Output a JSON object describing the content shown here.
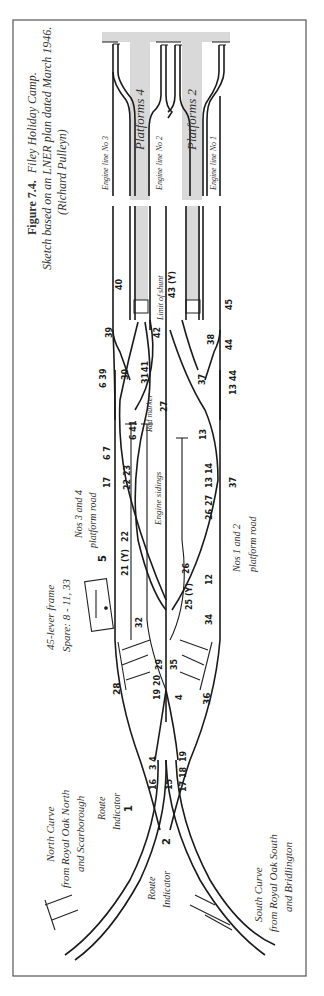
{
  "caption": {
    "figure_label": "Figure 7.4.",
    "title": "Filey Holiday Camp.",
    "line2": "Sketch based on an LNER plan dated March 1946.",
    "credit": "(Richard Pulleyn)"
  },
  "labels": {
    "platforms_4": "Platforms 4",
    "platforms_2": "Platforms 2",
    "plat_num_3": "3",
    "plat_num_1": "1",
    "engine_line_3": "Engine line No 3",
    "engine_line_2": "Engine line No 2",
    "engine_line_1": "Engine line No 1",
    "limit_of_shunt": "Limit of shunt",
    "red_marker": "Red marker",
    "engine_sidings": "Engine sidings",
    "nos_3_4_a": "Nos 3 and 4",
    "nos_3_4_b": "platform road",
    "nos_1_2_a": "Nos 1 and 2",
    "nos_1_2_b": "platform road",
    "lever_frame_a": "45-lever frame",
    "lever_frame_b": "Spare: 8 - 11, 33",
    "route_indicator_top_a": "Route",
    "route_indicator_top_b": "Indicator",
    "route_indicator_bot_a": "Route",
    "route_indicator_bot_b": "Indicator",
    "north_curve_a": "North Curve",
    "north_curve_b": "from Royal Oak North",
    "north_curve_c": "and Scarborough",
    "south_curve_a": "South Curve",
    "south_curve_b": "from Royal Oak South",
    "south_curve_c": "and Bridlington"
  },
  "lever_numbers": {
    "n40": "40",
    "n43": "43 (Y)",
    "n45": "45",
    "n39a": "39",
    "n42": "42",
    "n38": "38",
    "n44a": "44",
    "n30": "30",
    "n31": "31",
    "n41": "41",
    "n37": "37",
    "n39b": "6 39",
    "n44b": "13 44",
    "n27top": "27",
    "n6_41": "6 41",
    "n13a": "13",
    "n67": "6 7",
    "n2223": "22 23",
    "n1314": "13 14",
    "n17": "17",
    "n2627": "26 27",
    "n37b": "37",
    "n5": "5",
    "n22": "22",
    "n21": "21 (Y)",
    "n26": "26",
    "n12": "12",
    "n25": "25 (Y)",
    "n32": "32",
    "n34": "34",
    "n29": "29",
    "n35": "35",
    "n28": "28",
    "n1920": "19 20",
    "n4": "4",
    "n36": "36",
    "n16": "16",
    "n34b": "3 4",
    "n15": "15",
    "n1718": "17 18",
    "n19": "19",
    "n1": "1",
    "n2": "2"
  }
}
